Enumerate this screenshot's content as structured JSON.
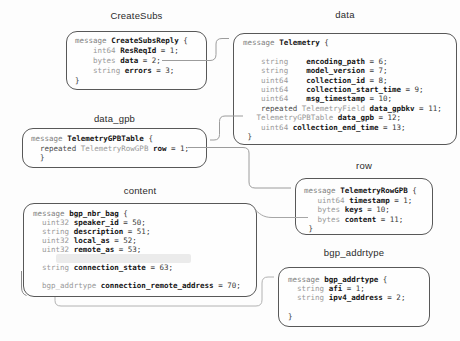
{
  "diagram": {
    "colors": {
      "box_border": "#585858",
      "keyword_gray": "#7d7d7d",
      "type_gray": "#989898",
      "field_name": "#141414",
      "connector": "#9c9c9c",
      "arrowhead": "#111111",
      "background": "#fdfdfd"
    },
    "connections": [
      {
        "from": "CreateSubsReply.data",
        "to": "Telemetry"
      },
      {
        "from": "Telemetry.data_gpb",
        "to": "TelemetryGPBTable"
      },
      {
        "from": "TelemetryGPBTable.row",
        "to": "TelemetryRowGPB"
      },
      {
        "from": "TelemetryRowGPB.content",
        "to": "bgp_nbr_bag"
      },
      {
        "from": "bgp_nbr_bag.connection_remote_address",
        "to": "bgp_addrtype"
      }
    ],
    "boxes": {
      "createsubs": {
        "label": "CreateSubs",
        "lines": [
          [
            [
              "kw",
              "message "
            ],
            [
              "nm",
              "CreateSubsReply"
            ],
            [
              "pl",
              " {"
            ]
          ],
          [
            [
              "pl",
              "    "
            ],
            [
              "ty",
              "int64"
            ],
            [
              "pl",
              " "
            ],
            [
              "nm",
              "ResReqId"
            ],
            [
              "pl",
              " = 1;"
            ]
          ],
          [
            [
              "pl",
              "    "
            ],
            [
              "ty",
              "bytes"
            ],
            [
              "pl",
              " "
            ],
            [
              "nm",
              "data"
            ],
            [
              "pl",
              " = 2;"
            ]
          ],
          [
            [
              "pl",
              "    "
            ],
            [
              "ty",
              "string"
            ],
            [
              "pl",
              " "
            ],
            [
              "nm",
              "errors"
            ],
            [
              "pl",
              " = 3;"
            ]
          ],
          [
            [
              "pl",
              "}"
            ]
          ]
        ]
      },
      "data": {
        "label": "data",
        "lines": [
          [
            [
              "kw",
              "message "
            ],
            [
              "nm",
              "Telemetry"
            ],
            [
              "pl",
              " {"
            ]
          ],
          [],
          [
            [
              "pl",
              "    "
            ],
            [
              "ty",
              "string"
            ],
            [
              "pl",
              "    "
            ],
            [
              "nm",
              "encoding_path"
            ],
            [
              "pl",
              " = 6;"
            ]
          ],
          [
            [
              "pl",
              "    "
            ],
            [
              "ty",
              "string"
            ],
            [
              "pl",
              "    "
            ],
            [
              "nm",
              "model_version"
            ],
            [
              "pl",
              " = 7;"
            ]
          ],
          [
            [
              "pl",
              "    "
            ],
            [
              "ty",
              "uint64"
            ],
            [
              "pl",
              "    "
            ],
            [
              "nm",
              "collection_id"
            ],
            [
              "pl",
              " = 8;"
            ]
          ],
          [
            [
              "pl",
              "    "
            ],
            [
              "ty",
              "uint64"
            ],
            [
              "pl",
              "    "
            ],
            [
              "nm",
              "collection_start_time"
            ],
            [
              "pl",
              " = 9;"
            ]
          ],
          [
            [
              "pl",
              "    "
            ],
            [
              "ty",
              "uint64"
            ],
            [
              "pl",
              "    "
            ],
            [
              "nm",
              "msg_timestamp"
            ],
            [
              "pl",
              " = 10;"
            ]
          ],
          [
            [
              "pl",
              "    "
            ],
            [
              "rp",
              "repeated"
            ],
            [
              "pl",
              " "
            ],
            [
              "ty",
              "TelemetryField"
            ],
            [
              "pl",
              " "
            ],
            [
              "nm",
              "data_gpbkv"
            ],
            [
              "pl",
              " = 11;"
            ]
          ],
          [
            [
              "pl",
              "   "
            ],
            [
              "ty",
              "TelemetryGPBTable"
            ],
            [
              "pl",
              " "
            ],
            [
              "nm",
              "data_gpb"
            ],
            [
              "pl",
              " = 12;"
            ]
          ],
          [
            [
              "pl",
              "    "
            ],
            [
              "ty",
              "uint64"
            ],
            [
              "pl",
              " "
            ],
            [
              "nm",
              "collection_end_time"
            ],
            [
              "pl",
              " = 13;"
            ]
          ],
          [
            [
              "pl",
              " }"
            ]
          ]
        ]
      },
      "data_gpb": {
        "label": "data_gpb",
        "lines": [
          [
            [
              "kw",
              "message "
            ],
            [
              "nm",
              "TelemetryGPBTable"
            ],
            [
              "pl",
              " {"
            ]
          ],
          [
            [
              "pl",
              "  "
            ],
            [
              "rp",
              "repeated"
            ],
            [
              "pl",
              " "
            ],
            [
              "ty",
              "TelemetryRowGPB"
            ],
            [
              "pl",
              " "
            ],
            [
              "nm",
              "row"
            ],
            [
              "pl",
              " = 1;"
            ]
          ],
          [
            [
              "pl",
              "  }"
            ]
          ]
        ]
      },
      "row": {
        "label": "row",
        "lines": [
          [
            [
              "kw",
              "message "
            ],
            [
              "nm",
              "TelemetryRowGPB"
            ],
            [
              "pl",
              " {"
            ]
          ],
          [
            [
              "pl",
              "   "
            ],
            [
              "ty",
              "uint64"
            ],
            [
              "pl",
              " "
            ],
            [
              "nm",
              "timestamp"
            ],
            [
              "pl",
              " = 1;"
            ]
          ],
          [
            [
              "pl",
              "   "
            ],
            [
              "ty",
              "bytes"
            ],
            [
              "pl",
              " "
            ],
            [
              "nm",
              "keys"
            ],
            [
              "pl",
              " = 10;"
            ]
          ],
          [
            [
              "pl",
              "   "
            ],
            [
              "ty",
              "bytes"
            ],
            [
              "pl",
              " "
            ],
            [
              "nm",
              "content"
            ],
            [
              "pl",
              " = 11;"
            ]
          ],
          [
            [
              "pl",
              " }"
            ]
          ]
        ]
      },
      "content": {
        "label": "content",
        "lines": [
          [
            [
              "kw",
              "message "
            ],
            [
              "nm",
              "bgp_nbr_bag"
            ],
            [
              "pl",
              " {"
            ]
          ],
          [
            [
              "pl",
              "  "
            ],
            [
              "ty",
              "uint32"
            ],
            [
              "pl",
              " "
            ],
            [
              "nm",
              "speaker_id"
            ],
            [
              "pl",
              " = 50;"
            ]
          ],
          [
            [
              "pl",
              "  "
            ],
            [
              "ty",
              "string"
            ],
            [
              "pl",
              " "
            ],
            [
              "nm",
              "description"
            ],
            [
              "pl",
              " = 51;"
            ]
          ],
          [
            [
              "pl",
              "  "
            ],
            [
              "ty",
              "uint32"
            ],
            [
              "pl",
              " "
            ],
            [
              "nm",
              "local_as"
            ],
            [
              "pl",
              " = 52;"
            ]
          ],
          [
            [
              "pl",
              "  "
            ],
            [
              "ty",
              "uint32"
            ],
            [
              "pl",
              " "
            ],
            [
              "nm",
              "remote_as"
            ],
            [
              "pl",
              " = 53;"
            ]
          ],
          [
            [
              "pl",
              "     "
            ],
            [
              "sm",
              "                              "
            ]
          ],
          [
            [
              "pl",
              "  "
            ],
            [
              "ty",
              "string"
            ],
            [
              "pl",
              " "
            ],
            [
              "nm",
              "connection_state"
            ],
            [
              "pl",
              " = 63;"
            ]
          ],
          [],
          [
            [
              "pl",
              "  "
            ],
            [
              "ty",
              "bgp_addrtype"
            ],
            [
              "pl",
              " "
            ],
            [
              "nm",
              "connection_remote_address"
            ],
            [
              "pl",
              " = 70;"
            ]
          ]
        ]
      },
      "bgp_addrtype": {
        "label": "bgp_addrtype",
        "lines": [
          [
            [
              "kw",
              "message "
            ],
            [
              "nm",
              "bgp_addrtype"
            ],
            [
              "pl",
              " {"
            ]
          ],
          [
            [
              "pl",
              "  "
            ],
            [
              "ty",
              "string"
            ],
            [
              "pl",
              " "
            ],
            [
              "nm",
              "afi"
            ],
            [
              "pl",
              " = 1;"
            ]
          ],
          [
            [
              "pl",
              "  "
            ],
            [
              "ty",
              "string"
            ],
            [
              "pl",
              " "
            ],
            [
              "nm",
              "ipv4_address"
            ],
            [
              "pl",
              " = 2;"
            ]
          ],
          [],
          [
            [
              "pl",
              "}"
            ]
          ]
        ]
      }
    }
  }
}
